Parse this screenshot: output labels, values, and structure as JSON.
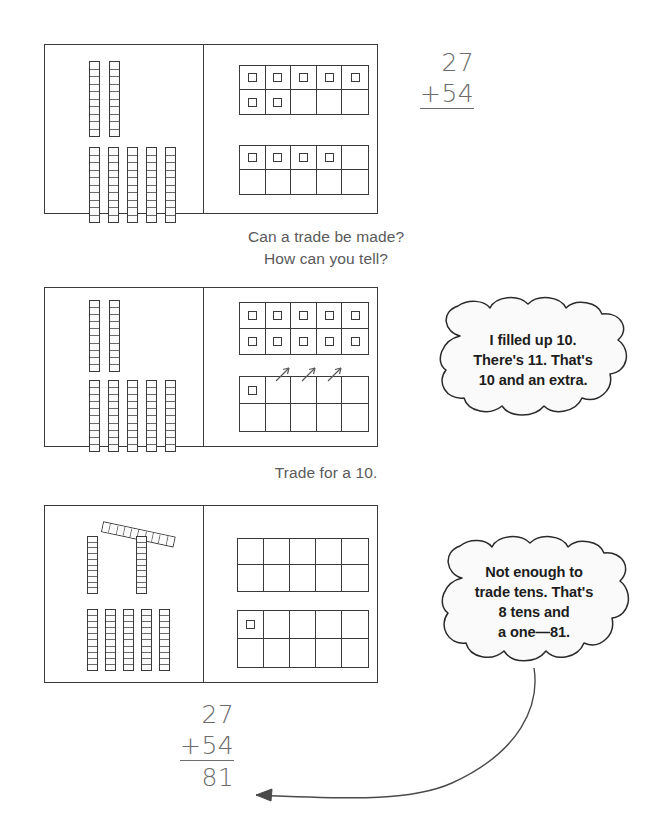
{
  "page": {
    "background": "#ffffff",
    "ink": "#3a3a3a",
    "text_color": "#5a5a5a"
  },
  "problem": {
    "addend_top": "27",
    "addend_bottom": "+54",
    "sum": "81"
  },
  "top_sum": {
    "line1": "27",
    "line2": "+54"
  },
  "bottom_sum": {
    "line1": "27",
    "line2": "+54",
    "line3": "81"
  },
  "captions": {
    "first": "Can a trade be made?",
    "second": "How can you tell?",
    "third": "Trade for a 10."
  },
  "bubbles": [
    {
      "name": "bubble-filled-up-ten",
      "lines": [
        "I filled up 10.",
        "There's 11. That's",
        "10 and an extra."
      ]
    },
    {
      "name": "bubble-not-enough-to-trade",
      "lines": [
        "Not enough to",
        "trade tens. That's",
        "8 tens and",
        "a one—81."
      ]
    }
  ],
  "panels": [
    {
      "name": "panel-1-before-trade",
      "left_side": {
        "label": "tens-rods",
        "top_row_rods": 2,
        "bottom_row_rods": 5,
        "segments_per_rod": 10
      },
      "right_side": {
        "label": "ones-ten-frames",
        "frames": [
          {
            "name": "ten-frame-top",
            "filled": 7
          },
          {
            "name": "ten-frame-bottom",
            "filled": 4
          }
        ]
      },
      "arrows": 0,
      "diagonal_rod": false
    },
    {
      "name": "panel-2-making-the-ten",
      "left_side": {
        "label": "tens-rods",
        "top_row_rods": 2,
        "bottom_row_rods": 5,
        "segments_per_rod": 10
      },
      "right_side": {
        "label": "ones-ten-frames",
        "frames": [
          {
            "name": "ten-frame-top",
            "filled": 10
          },
          {
            "name": "ten-frame-bottom",
            "filled": 1
          }
        ]
      },
      "arrows": 3,
      "diagonal_rod": false
    },
    {
      "name": "panel-3-after-trade",
      "left_side": {
        "label": "tens-rods",
        "top_row_rods": 2,
        "bottom_row_rods": 5,
        "segments_per_rod": 10,
        "traded_rod_note": "diagonal traded ten rod"
      },
      "right_side": {
        "label": "ones-ten-frames",
        "frames": [
          {
            "name": "ten-frame-top",
            "filled": 0
          },
          {
            "name": "ten-frame-bottom",
            "filled": 1
          }
        ]
      },
      "arrows": 0,
      "diagonal_rod": true
    }
  ],
  "pointer": {
    "name": "curved-arrow-to-sum",
    "from": "bubble-not-enough-to-trade",
    "to": "81"
  }
}
